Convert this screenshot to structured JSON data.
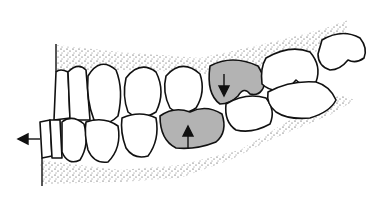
{
  "figure": {
    "description": "Line drawing of a dental arch in lateral view showing upper and lower teeth in occlusion; two shaded molars with opposing vertical arrows and a leftward arrow at the incisors indicating anterior drift.",
    "colors": {
      "background": "#ffffff",
      "outline": "#111111",
      "shaded_teeth": "#b3b3b3",
      "gum_stipple": "#222222"
    },
    "arrows": [
      {
        "name": "upper-shaded-molar-arrow",
        "direction": "down"
      },
      {
        "name": "lower-shaded-molar-arrow",
        "direction": "up"
      },
      {
        "name": "incisor-drift-arrow",
        "direction": "left"
      }
    ]
  }
}
